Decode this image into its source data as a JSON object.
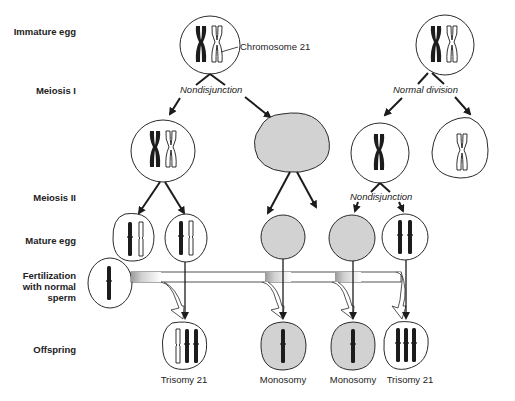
{
  "row_labels": {
    "immature_egg": "Immature egg",
    "meiosis_1": "Meiosis I",
    "meiosis_2": "Meiosis II",
    "mature_egg": "Mature egg",
    "fertilization_line1": "Fertilization",
    "fertilization_line2": "with normal",
    "fertilization_line3": "sperm",
    "offspring": "Offspring"
  },
  "annotations": {
    "chromosome_label": "Chromosome  21",
    "meiosis1_left": "Nondisjunction",
    "meiosis1_right": "Normal division",
    "meiosis2_right": "Nondisjunction"
  },
  "captions": [
    "Trisomy 21",
    "Monosomy",
    "Monosomy",
    "Trisomy 21"
  ],
  "colors": {
    "outline": "#2a2a2a",
    "chromosome_dark": "#1c1c1c",
    "empty_cell_fill": "#d2d2d2",
    "band_shade": "#bdbdbd"
  }
}
